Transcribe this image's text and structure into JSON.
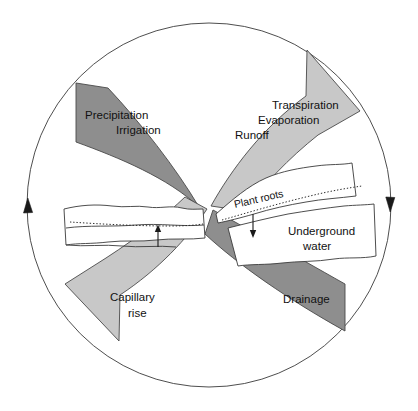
{
  "diagram": {
    "background_color": "#ffffff",
    "colors": {
      "arrow_dark": "#8e8e8e",
      "arrow_light": "#c8c8c8",
      "outline": "#3a3a3a",
      "text": "#111111",
      "soil_fill": "#ffffff"
    },
    "circle": {
      "center_x": 209,
      "center_y": 205,
      "radius": 182,
      "direction": "clockwise",
      "arrowhead_left": "up-arrowhead",
      "arrowhead_right": "down-arrowhead"
    },
    "arrows": [
      {
        "id": "precipitation-irrigation",
        "shade": "dark",
        "color": "#8e8e8e",
        "quadrant": "top-left",
        "direction": "inward to center",
        "lines": [
          "Precipitation",
          "Irrigation"
        ]
      },
      {
        "id": "transpiration-evaporation-runoff",
        "shade": "light",
        "color": "#c8c8c8",
        "quadrant": "top-right",
        "direction": "outward up-right",
        "lines": [
          "Transpiration",
          "Evaporation",
          "Runoff"
        ]
      },
      {
        "id": "capillary-rise",
        "shade": "light",
        "color": "#c8c8c8",
        "quadrant": "bottom-left",
        "direction": "outward down-left",
        "lines": [
          "Capillary",
          "rise"
        ]
      },
      {
        "id": "drainage",
        "shade": "dark",
        "color": "#8e8e8e",
        "quadrant": "bottom-right",
        "direction": "outward down-right",
        "lines": [
          "Drainage"
        ]
      }
    ],
    "soil": {
      "left_block": {
        "id": "left-soil-block",
        "has_dotted_water_table": true,
        "flow_arrow": "up"
      },
      "right_block": {
        "id": "right-soil-block",
        "has_dotted_water_table": true,
        "flow_arrow": "down",
        "labels": [
          {
            "id": "plant-roots",
            "text": "Plant roots",
            "rotated": true
          },
          {
            "id": "underground-water",
            "lines": [
              "Underground",
              "water"
            ]
          }
        ]
      }
    },
    "label_text": {
      "precipitation": "Precipitation",
      "irrigation": "Irrigation",
      "transpiration": "Transpiration",
      "evaporation": "Evaporation",
      "runoff": "Runoff",
      "capillary": "Capillary",
      "rise": "rise",
      "drainage": "Drainage",
      "plant_roots": "Plant roots",
      "underground": "Underground",
      "water": "water"
    }
  }
}
